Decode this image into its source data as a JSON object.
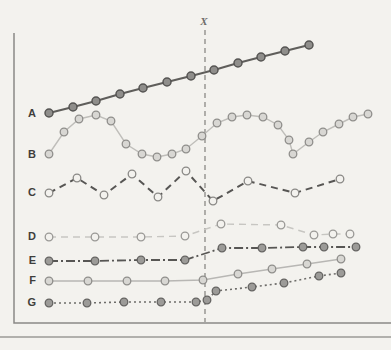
{
  "figure": {
    "background": "#f3f2ee",
    "axis_color": "#8a8986",
    "axis": {
      "left_x": 14,
      "top_y": 33,
      "bottom_y": 323,
      "right_x": 391
    },
    "separator": {
      "y": 337,
      "x1": 0,
      "x2": 391,
      "color": "#9b9a96",
      "width": 1.4
    }
  },
  "chart_data": {
    "type": "line",
    "title": "",
    "xlabel": "",
    "ylabel": "",
    "axes_note": "unlabeled schematic axes (no ticks); coordinates below are pixel positions in the 391x350 image, y increases downward",
    "legend": "none",
    "grid": false,
    "intervention_line": {
      "label": "X",
      "x": 205,
      "y1": 30,
      "y2": 322,
      "color": "#8a8986",
      "dash": "5,4",
      "label_x": 204,
      "label_y": 25
    },
    "series": [
      {
        "name": "A",
        "pattern": "steady linear rise across X",
        "label_x": 36,
        "label_y": 117,
        "line": {
          "color": "#5f5e5b",
          "width": 2.2,
          "dash": ""
        },
        "marker": {
          "fill": "#8f8e8b",
          "stroke": "#565553",
          "r": 4,
          "stroke_width": 1.5
        },
        "points": [
          [
            49,
            113
          ],
          [
            73,
            107
          ],
          [
            96,
            101
          ],
          [
            120,
            94
          ],
          [
            143,
            88
          ],
          [
            167,
            82
          ],
          [
            191,
            76
          ],
          [
            214,
            70
          ],
          [
            238,
            63
          ],
          [
            261,
            57
          ],
          [
            285,
            51
          ],
          [
            309,
            45
          ]
        ]
      },
      {
        "name": "B",
        "pattern": "repeating cyclical wave unaffected by X",
        "label_x": 36,
        "label_y": 158,
        "line": {
          "color": "#bfbeba",
          "width": 1.4,
          "dash": ""
        },
        "marker": {
          "fill": "#d8d7d3",
          "stroke": "#8f8e8b",
          "r": 3.8,
          "stroke_width": 1.3
        },
        "points": [
          [
            49,
            154
          ],
          [
            64,
            132
          ],
          [
            79,
            119
          ],
          [
            96,
            115
          ],
          [
            111,
            121
          ],
          [
            126,
            144
          ],
          [
            142,
            154
          ],
          [
            157,
            157
          ],
          [
            172,
            154
          ],
          [
            186,
            149
          ],
          [
            202,
            136
          ],
          [
            217,
            123
          ],
          [
            232,
            117
          ],
          [
            247,
            115
          ],
          [
            263,
            117
          ],
          [
            278,
            125
          ],
          [
            289,
            140
          ],
          [
            293,
            154
          ],
          [
            309,
            142
          ],
          [
            323,
            132
          ],
          [
            339,
            124
          ],
          [
            353,
            117
          ],
          [
            368,
            114
          ]
        ]
      },
      {
        "name": "C",
        "pattern": "regular zigzag oscillation across X",
        "label_x": 36,
        "label_y": 196,
        "line": {
          "color": "#575654",
          "width": 2,
          "dash": "7,5"
        },
        "marker": {
          "fill": "#f3f2ee",
          "stroke": "#8a8986",
          "r": 3.8,
          "stroke_width": 1.3
        },
        "points": [
          [
            49,
            193
          ],
          [
            77,
            178
          ],
          [
            104,
            195
          ],
          [
            132,
            174
          ],
          [
            158,
            197
          ],
          [
            186,
            171
          ],
          [
            213,
            201
          ],
          [
            248,
            181
          ],
          [
            295,
            193
          ],
          [
            340,
            179
          ]
        ]
      },
      {
        "name": "D",
        "pattern": "flat, brief rise just after X, returns to baseline",
        "label_x": 36,
        "label_y": 240,
        "line": {
          "color": "#c7c6c2",
          "width": 1.4,
          "dash": "7,5"
        },
        "marker": {
          "fill": "#f3f2ee",
          "stroke": "#9a9996",
          "r": 3.8,
          "stroke_width": 1.3
        },
        "points": [
          [
            49,
            237
          ],
          [
            95,
            237
          ],
          [
            141,
            237
          ],
          [
            185,
            236
          ],
          [
            221,
            224
          ],
          [
            281,
            225
          ],
          [
            314,
            235
          ],
          [
            333,
            234
          ],
          [
            350,
            234
          ]
        ]
      },
      {
        "name": "E",
        "pattern": "flat baseline, permanent level jump at X",
        "label_x": 36,
        "label_y": 264,
        "line": {
          "color": "#575654",
          "width": 1.8,
          "dash": "9,3,2,3"
        },
        "marker": {
          "fill": "#9c9b98",
          "stroke": "#646361",
          "r": 3.8,
          "stroke_width": 1.3
        },
        "points": [
          [
            49,
            261
          ],
          [
            95,
            261
          ],
          [
            141,
            260
          ],
          [
            185,
            260
          ],
          [
            222,
            248
          ],
          [
            262,
            248
          ],
          [
            303,
            247
          ],
          [
            324,
            247
          ],
          [
            356,
            247
          ]
        ]
      },
      {
        "name": "F",
        "pattern": "flat baseline, slope change (gradual rise) after X",
        "label_x": 36,
        "label_y": 284,
        "line": {
          "color": "#b8b7b4",
          "width": 1.3,
          "dash": ""
        },
        "marker": {
          "fill": "#d8d7d3",
          "stroke": "#8f8e8b",
          "r": 3.8,
          "stroke_width": 1.3
        },
        "points": [
          [
            49,
            281
          ],
          [
            88,
            281
          ],
          [
            127,
            281
          ],
          [
            165,
            281
          ],
          [
            203,
            280
          ],
          [
            238,
            274
          ],
          [
            272,
            269
          ],
          [
            307,
            264
          ],
          [
            341,
            259
          ]
        ]
      },
      {
        "name": "G",
        "pattern": "flat baseline, level jump plus rising slope after X",
        "label_x": 36,
        "label_y": 306,
        "line": {
          "color": "#6e6d6a",
          "width": 1.6,
          "dash": "2,3"
        },
        "marker": {
          "fill": "#9c9b98",
          "stroke": "#646361",
          "r": 3.8,
          "stroke_width": 1.3
        },
        "points": [
          [
            49,
            303
          ],
          [
            87,
            303
          ],
          [
            124,
            302
          ],
          [
            161,
            302
          ],
          [
            196,
            302
          ],
          [
            207,
            300
          ],
          [
            216,
            291
          ],
          [
            252,
            287
          ],
          [
            284,
            283
          ],
          [
            319,
            276
          ],
          [
            341,
            273
          ]
        ]
      }
    ]
  }
}
